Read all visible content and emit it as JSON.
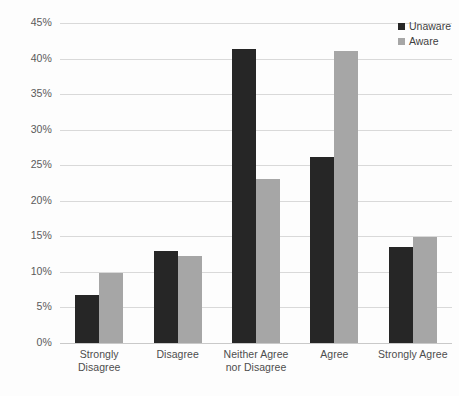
{
  "chart_data": {
    "type": "bar",
    "title": "",
    "subtitle": "",
    "xlabel": "",
    "ylabel": "",
    "ylim": [
      0,
      45
    ],
    "ytick_step": 5,
    "ytick_labels": [
      "45%",
      "40%",
      "35%",
      "30%",
      "25%",
      "20%",
      "15%",
      "10%",
      "5%",
      "0%"
    ],
    "ytick_values": [
      45,
      40,
      35,
      30,
      25,
      20,
      15,
      10,
      5,
      0
    ],
    "grid": true,
    "value_suffix": "%",
    "legend_position": "top-right",
    "categories": [
      "Strongly Disagree",
      "Disagree",
      "Neither Agree nor Disagree",
      "Agree",
      "Strongly Agree"
    ],
    "series": [
      {
        "name": "Unaware",
        "color": "#262626",
        "values": [
          6.7,
          12.9,
          41.4,
          26.1,
          13.5
        ]
      },
      {
        "name": "Aware",
        "color": "#a6a6a6",
        "values": [
          9.8,
          12.2,
          23.0,
          41.0,
          14.9
        ]
      }
    ],
    "annotations": []
  },
  "legend": {
    "entries": [
      {
        "label": "Unaware",
        "swatch": "square-marker-dark"
      },
      {
        "label": "Aware",
        "swatch": "square-marker-gray"
      }
    ]
  },
  "colors": {
    "unaware": "#262626",
    "aware": "#a6a6a6",
    "gridline": "#d9d9d9",
    "axis_text": "#5a5a5a",
    "background": "#fdfdfd"
  }
}
